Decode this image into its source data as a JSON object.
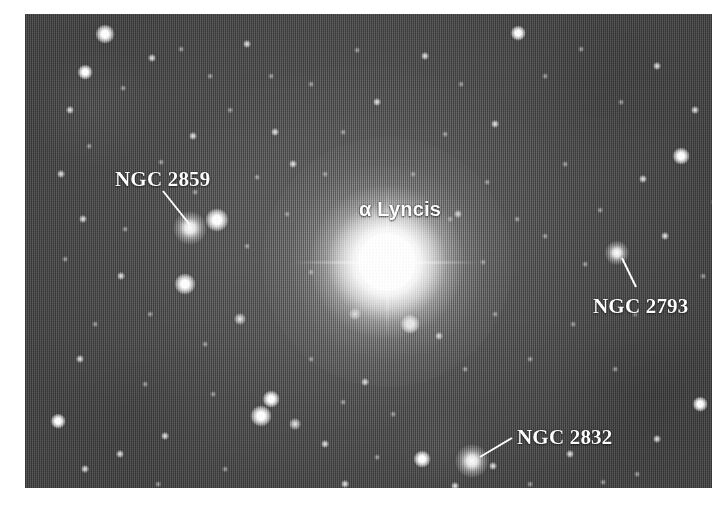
{
  "figure": {
    "kind": "astronomical-photograph",
    "border_color": "#ffffff",
    "sky_color": "#555555",
    "label_color": "#ffffff",
    "plate": {
      "left": 25,
      "top": 14,
      "width": 687,
      "height": 474
    }
  },
  "annotations": [
    {
      "id": "ngc-2859",
      "label": "NGC 2859",
      "style": "serif",
      "label_x": 90,
      "label_y": 155,
      "line": {
        "x1": 138,
        "y1": 177,
        "x2": 165,
        "y2": 211
      },
      "target": {
        "x": 165,
        "y": 214,
        "size": 15,
        "kind": "fuzzy"
      }
    },
    {
      "id": "alpha-lyncis",
      "label": "α Lyncis",
      "style": "sans",
      "label_x": 334,
      "label_y": 185,
      "line": null,
      "target": {
        "x": 362,
        "y": 248,
        "size": 250,
        "kind": "bright-star"
      }
    },
    {
      "id": "ngc-2793",
      "label": "NGC 2793",
      "style": "serif",
      "label_x": 568,
      "label_y": 282,
      "line": {
        "x1": 611,
        "y1": 273,
        "x2": 597,
        "y2": 244
      },
      "target": {
        "x": 592,
        "y": 239,
        "size": 11,
        "kind": "fuzzy"
      }
    },
    {
      "id": "ngc-2832",
      "label": "NGC 2832",
      "style": "serif",
      "label_x": 492,
      "label_y": 413,
      "line": {
        "x1": 487,
        "y1": 424,
        "x2": 455,
        "y2": 443
      },
      "target": {
        "x": 447,
        "y": 447,
        "size": 15,
        "kind": "fuzzy"
      }
    }
  ],
  "stars": [
    {
      "x": 80,
      "y": 20,
      "s": 9,
      "c": "bright"
    },
    {
      "x": 127,
      "y": 44,
      "s": 4,
      "c": "faint"
    },
    {
      "x": 60,
      "y": 58,
      "s": 7,
      "c": "bright"
    },
    {
      "x": 45,
      "y": 96,
      "s": 4,
      "c": "faint"
    },
    {
      "x": 98,
      "y": 74,
      "s": 3,
      "c": "dim"
    },
    {
      "x": 156,
      "y": 35,
      "s": 3,
      "c": "dim"
    },
    {
      "x": 185,
      "y": 62,
      "s": 3,
      "c": "dim"
    },
    {
      "x": 222,
      "y": 30,
      "s": 4,
      "c": "faint"
    },
    {
      "x": 246,
      "y": 62,
      "s": 3,
      "c": "dim"
    },
    {
      "x": 205,
      "y": 96,
      "s": 3,
      "c": "dim"
    },
    {
      "x": 250,
      "y": 118,
      "s": 4,
      "c": "faint"
    },
    {
      "x": 168,
      "y": 122,
      "s": 4,
      "c": "faint"
    },
    {
      "x": 64,
      "y": 132,
      "s": 3,
      "c": "dim"
    },
    {
      "x": 36,
      "y": 160,
      "s": 4,
      "c": "faint"
    },
    {
      "x": 136,
      "y": 148,
      "s": 3,
      "c": "dim"
    },
    {
      "x": 232,
      "y": 163,
      "s": 3,
      "c": "dim"
    },
    {
      "x": 268,
      "y": 150,
      "s": 4,
      "c": "faint"
    },
    {
      "x": 192,
      "y": 206,
      "s": 11,
      "c": "bright"
    },
    {
      "x": 160,
      "y": 270,
      "s": 10,
      "c": "bright"
    },
    {
      "x": 222,
      "y": 232,
      "s": 3,
      "c": "dim"
    },
    {
      "x": 100,
      "y": 215,
      "s": 3,
      "c": "dim"
    },
    {
      "x": 58,
      "y": 205,
      "s": 4,
      "c": "faint"
    },
    {
      "x": 40,
      "y": 245,
      "s": 3,
      "c": "dim"
    },
    {
      "x": 96,
      "y": 262,
      "s": 4,
      "c": "faint"
    },
    {
      "x": 125,
      "y": 300,
      "s": 3,
      "c": "dim"
    },
    {
      "x": 70,
      "y": 310,
      "s": 3,
      "c": "dim"
    },
    {
      "x": 215,
      "y": 305,
      "s": 6,
      "c": "faint"
    },
    {
      "x": 180,
      "y": 330,
      "s": 3,
      "c": "dim"
    },
    {
      "x": 246,
      "y": 385,
      "s": 8,
      "c": "bright"
    },
    {
      "x": 236,
      "y": 402,
      "s": 10,
      "c": "bright"
    },
    {
      "x": 270,
      "y": 410,
      "s": 6,
      "c": "faint"
    },
    {
      "x": 33,
      "y": 407,
      "s": 7,
      "c": "bright"
    },
    {
      "x": 55,
      "y": 345,
      "s": 4,
      "c": "faint"
    },
    {
      "x": 95,
      "y": 440,
      "s": 4,
      "c": "faint"
    },
    {
      "x": 60,
      "y": 455,
      "s": 4,
      "c": "faint"
    },
    {
      "x": 140,
      "y": 422,
      "s": 4,
      "c": "faint"
    },
    {
      "x": 133,
      "y": 470,
      "s": 3,
      "c": "dim"
    },
    {
      "x": 188,
      "y": 380,
      "s": 3,
      "c": "dim"
    },
    {
      "x": 200,
      "y": 455,
      "s": 3,
      "c": "dim"
    },
    {
      "x": 286,
      "y": 345,
      "s": 3,
      "c": "dim"
    },
    {
      "x": 300,
      "y": 430,
      "s": 4,
      "c": "faint"
    },
    {
      "x": 320,
      "y": 470,
      "s": 4,
      "c": "faint"
    },
    {
      "x": 330,
      "y": 300,
      "s": 6,
      "c": "faint"
    },
    {
      "x": 340,
      "y": 368,
      "s": 4,
      "c": "faint"
    },
    {
      "x": 286,
      "y": 70,
      "s": 3,
      "c": "dim"
    },
    {
      "x": 318,
      "y": 118,
      "s": 3,
      "c": "dim"
    },
    {
      "x": 352,
      "y": 88,
      "s": 4,
      "c": "faint"
    },
    {
      "x": 300,
      "y": 160,
      "s": 3,
      "c": "dim"
    },
    {
      "x": 388,
      "y": 160,
      "s": 3,
      "c": "dim"
    },
    {
      "x": 420,
      "y": 120,
      "s": 3,
      "c": "dim"
    },
    {
      "x": 332,
      "y": 36,
      "s": 3,
      "c": "dim"
    },
    {
      "x": 400,
      "y": 42,
      "s": 4,
      "c": "faint"
    },
    {
      "x": 436,
      "y": 70,
      "s": 3,
      "c": "dim"
    },
    {
      "x": 470,
      "y": 110,
      "s": 4,
      "c": "faint"
    },
    {
      "x": 493,
      "y": 19,
      "s": 7,
      "c": "bright"
    },
    {
      "x": 520,
      "y": 62,
      "s": 3,
      "c": "dim"
    },
    {
      "x": 556,
      "y": 35,
      "s": 3,
      "c": "dim"
    },
    {
      "x": 596,
      "y": 88,
      "s": 3,
      "c": "dim"
    },
    {
      "x": 632,
      "y": 52,
      "s": 4,
      "c": "faint"
    },
    {
      "x": 670,
      "y": 96,
      "s": 4,
      "c": "faint"
    },
    {
      "x": 425,
      "y": 205,
      "s": 3,
      "c": "dim"
    },
    {
      "x": 433,
      "y": 200,
      "s": 4,
      "c": "faint"
    },
    {
      "x": 462,
      "y": 168,
      "s": 3,
      "c": "dim"
    },
    {
      "x": 492,
      "y": 205,
      "s": 3,
      "c": "dim"
    },
    {
      "x": 540,
      "y": 150,
      "s": 3,
      "c": "dim"
    },
    {
      "x": 575,
      "y": 196,
      "s": 3,
      "c": "dim"
    },
    {
      "x": 618,
      "y": 165,
      "s": 4,
      "c": "faint"
    },
    {
      "x": 656,
      "y": 142,
      "s": 8,
      "c": "bright"
    },
    {
      "x": 690,
      "y": 188,
      "s": 4,
      "c": "faint"
    },
    {
      "x": 640,
      "y": 222,
      "s": 4,
      "c": "faint"
    },
    {
      "x": 560,
      "y": 250,
      "s": 3,
      "c": "dim"
    },
    {
      "x": 678,
      "y": 262,
      "s": 3,
      "c": "dim"
    },
    {
      "x": 700,
      "y": 320,
      "s": 4,
      "c": "faint"
    },
    {
      "x": 385,
      "y": 310,
      "s": 9,
      "c": "bright"
    },
    {
      "x": 414,
      "y": 322,
      "s": 4,
      "c": "faint"
    },
    {
      "x": 440,
      "y": 355,
      "s": 3,
      "c": "dim"
    },
    {
      "x": 470,
      "y": 300,
      "s": 3,
      "c": "dim"
    },
    {
      "x": 505,
      "y": 345,
      "s": 3,
      "c": "dim"
    },
    {
      "x": 548,
      "y": 310,
      "s": 3,
      "c": "dim"
    },
    {
      "x": 590,
      "y": 355,
      "s": 3,
      "c": "dim"
    },
    {
      "x": 675,
      "y": 390,
      "s": 7,
      "c": "bright"
    },
    {
      "x": 632,
      "y": 425,
      "s": 4,
      "c": "faint"
    },
    {
      "x": 700,
      "y": 445,
      "s": 4,
      "c": "faint"
    },
    {
      "x": 397,
      "y": 445,
      "s": 8,
      "c": "bright"
    },
    {
      "x": 430,
      "y": 472,
      "s": 4,
      "c": "faint"
    },
    {
      "x": 468,
      "y": 452,
      "s": 4,
      "c": "faint"
    },
    {
      "x": 505,
      "y": 470,
      "s": 3,
      "c": "dim"
    },
    {
      "x": 545,
      "y": 440,
      "s": 4,
      "c": "faint"
    },
    {
      "x": 578,
      "y": 468,
      "s": 3,
      "c": "dim"
    },
    {
      "x": 612,
      "y": 460,
      "s": 3,
      "c": "dim"
    },
    {
      "x": 368,
      "y": 400,
      "s": 3,
      "c": "dim"
    },
    {
      "x": 352,
      "y": 443,
      "s": 3,
      "c": "dim"
    },
    {
      "x": 318,
      "y": 388,
      "s": 3,
      "c": "dim"
    },
    {
      "x": 250,
      "y": 478,
      "s": 3,
      "c": "dim"
    },
    {
      "x": 170,
      "y": 178,
      "s": 3,
      "c": "dim"
    },
    {
      "x": 120,
      "y": 370,
      "s": 3,
      "c": "dim"
    },
    {
      "x": 458,
      "y": 248,
      "s": 3,
      "c": "dim"
    },
    {
      "x": 520,
      "y": 222,
      "s": 3,
      "c": "dim"
    },
    {
      "x": 610,
      "y": 300,
      "s": 3,
      "c": "dim"
    },
    {
      "x": 286,
      "y": 258,
      "s": 3,
      "c": "dim"
    },
    {
      "x": 262,
      "y": 200,
      "s": 3,
      "c": "dim"
    }
  ]
}
